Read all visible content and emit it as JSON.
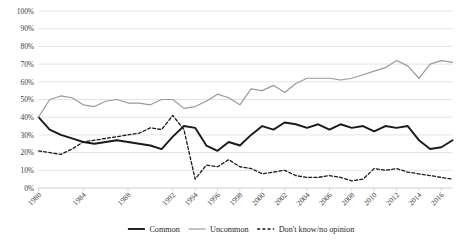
{
  "chart_data": {
    "type": "line",
    "title": "",
    "subtitle": "",
    "xlabel": "",
    "ylabel": "",
    "ylim": [
      0,
      100
    ],
    "y_tick_labels": [
      "0%",
      "10%",
      "20%",
      "30%",
      "40%",
      "50%",
      "60%",
      "70%",
      "80%",
      "90%",
      "100%"
    ],
    "y_tick_values": [
      0,
      10,
      20,
      30,
      40,
      50,
      60,
      70,
      80,
      90,
      100
    ],
    "grid": true,
    "legend_position": "bottom",
    "x": [
      1980,
      1981,
      1982,
      1983,
      1984,
      1985,
      1986,
      1987,
      1988,
      1989,
      1990,
      1991,
      1992,
      1993,
      1994,
      1995,
      1996,
      1997,
      1998,
      1999,
      2000,
      2001,
      2002,
      2003,
      2004,
      2005,
      2006,
      2007,
      2008,
      2009,
      2010,
      2011,
      2012,
      2013,
      2014,
      2015,
      2016,
      2017
    ],
    "x_tick_labels": [
      "1980",
      "1984",
      "1988",
      "1992",
      "1994",
      "1996",
      "1998",
      "2000",
      "2002",
      "2004",
      "2006",
      "2008",
      "2010",
      "2012",
      "2014",
      "2016"
    ],
    "x_tick_values": [
      1980,
      1984,
      1988,
      1992,
      1994,
      1996,
      1998,
      2000,
      2002,
      2004,
      2006,
      2008,
      2010,
      2012,
      2014,
      2016
    ],
    "series": [
      {
        "name": "Common",
        "color": "#1a1a1a",
        "width": 1.9,
        "dash": "none",
        "values": [
          40,
          33,
          30,
          28,
          26,
          25,
          26,
          27,
          26,
          25,
          24,
          22,
          29,
          35,
          34,
          24,
          21,
          26,
          24,
          30,
          35,
          33,
          37,
          36,
          34,
          36,
          33,
          36,
          34,
          35,
          32,
          35,
          34,
          35,
          27,
          22,
          23,
          27
        ]
      },
      {
        "name": "Uncommon",
        "color": "#9a9a9a",
        "width": 1.2,
        "dash": "none",
        "values": [
          40,
          50,
          52,
          51,
          47,
          46,
          49,
          50,
          48,
          48,
          47,
          50,
          50,
          45,
          46,
          49,
          53,
          51,
          47,
          56,
          55,
          58,
          54,
          59,
          62,
          62,
          62,
          61,
          62,
          64,
          66,
          68,
          72,
          69,
          62,
          70,
          72,
          71
        ]
      },
      {
        "name": "Don't know/no opinion",
        "color": "#1a1a1a",
        "width": 1.3,
        "dash": "3,2.2",
        "values": [
          21,
          20,
          19,
          22,
          26,
          27,
          28,
          29,
          30,
          31,
          34,
          33,
          41,
          33,
          5,
          13,
          12,
          16,
          12,
          11,
          8,
          9,
          10,
          7,
          6,
          6,
          7,
          6,
          4,
          5,
          11,
          10,
          11,
          9,
          8,
          7,
          6,
          5
        ]
      }
    ]
  },
  "legend": {
    "items": [
      {
        "label": "Common"
      },
      {
        "label": "Uncommon"
      },
      {
        "label": "Don't know/no opinion"
      }
    ]
  }
}
